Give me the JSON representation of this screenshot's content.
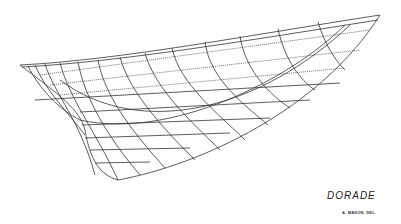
{
  "drawing": {
    "subject": "hull lines drawing",
    "title": "DORADE",
    "credit": "A. MASON, DEL.",
    "line_color": "#333333",
    "background": "#ffffff"
  }
}
